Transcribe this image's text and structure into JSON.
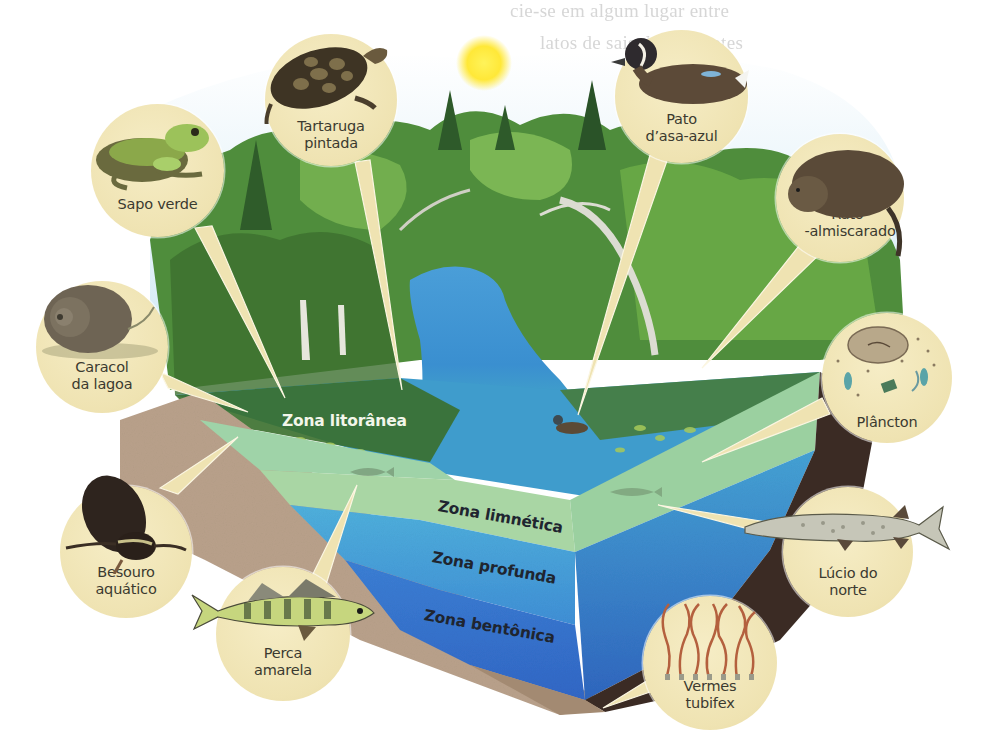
{
  "diagram": {
    "type": "lake-ecosystem-zones",
    "language": "pt-BR",
    "colors": {
      "callout_fill": "#efe3b2",
      "callout_text": "#3b3a30",
      "zona_litoranea": "#9fd3a8",
      "zona_limnetica": "#a9d6a4",
      "zona_profunda": "#4aa6d6",
      "zona_bentonica": "#3a76cf",
      "soil": "#b9a18b",
      "dark_bank": "#3b2b24",
      "water_surface": "#3d9ad2",
      "forest": "#4a8a3a",
      "sun": "#ffe838"
    }
  },
  "zones": {
    "litoranea": "Zona litorânea",
    "limnetica": "Zona limnética",
    "profunda": "Zona profunda",
    "bentonica": "Zona bentônica"
  },
  "organisms": [
    {
      "id": "sapo-verde",
      "label": "Sapo verde",
      "icon": "frog-icon"
    },
    {
      "id": "tartaruga-pintada",
      "label": "Tartaruga\npintada",
      "icon": "turtle-icon"
    },
    {
      "id": "pato-asa-azul",
      "label": "Pato\nd’asa-azul",
      "icon": "duck-icon"
    },
    {
      "id": "rato-almiscarado",
      "label": "Rato-\n-almiscarado",
      "icon": "muskrat-icon"
    },
    {
      "id": "caracol-lagoa",
      "label": "Caracol\nda lagoa",
      "icon": "snail-icon"
    },
    {
      "id": "plancton",
      "label": "Plâncton",
      "icon": "plankton-icon"
    },
    {
      "id": "besouro-aquatico",
      "label": "Besouro\naquático",
      "icon": "beetle-icon"
    },
    {
      "id": "lucio-norte",
      "label": "Lúcio do\nnorte",
      "icon": "pike-fish-icon"
    },
    {
      "id": "perca-amarela",
      "label": "Perca\namarela",
      "icon": "perch-fish-icon"
    },
    {
      "id": "vermes-tubifex",
      "label": "Vermes\ntubifex",
      "icon": "worms-icon"
    }
  ],
  "background_text": {
    "line1": "cie-se em algum lugar entre",
    "line2": "latos de sais, le nutrientes",
    "line3": "conta."
  }
}
